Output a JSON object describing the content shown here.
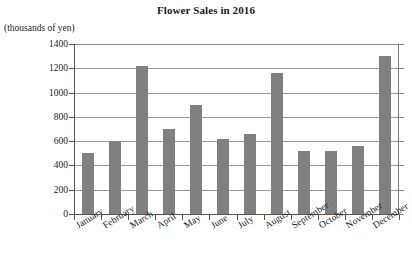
{
  "chart_data": {
    "type": "bar",
    "title": "Flower Sales in 2016",
    "xlabel": "",
    "ylabel": "(thousands of yen)",
    "ylim": [
      0,
      1400
    ],
    "ytick_step": 200,
    "grid": true,
    "legend": "none",
    "bar_color": "#808080",
    "categories": [
      "January",
      "February",
      "March",
      "April",
      "May",
      "June",
      "July",
      "August",
      "September",
      "October",
      "November",
      "December"
    ],
    "values": [
      500,
      600,
      1220,
      700,
      900,
      620,
      660,
      1160,
      520,
      520,
      560,
      1300
    ],
    "ytick_labels": [
      "0",
      "200",
      "400",
      "600",
      "800",
      "1000",
      "1200",
      "1400"
    ],
    "ytick_values": [
      0,
      200,
      400,
      600,
      800,
      1000,
      1200,
      1400
    ]
  }
}
